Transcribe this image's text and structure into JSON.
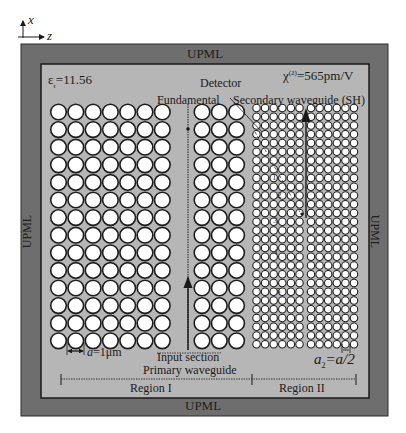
{
  "axes": {
    "x_label": "x",
    "z_label": "z"
  },
  "upml": {
    "top": "UPML",
    "bottom": "UPML",
    "left": "UPML",
    "right": "UPML"
  },
  "labels": {
    "permittivity": "ε",
    "permittivity_sub": "r",
    "permittivity_value": "=11.56",
    "chi_symbol": "χ",
    "chi_sup": "(2)",
    "chi_value": "=565pm/V",
    "detector": "Detector",
    "fundamental": "Fundamental",
    "secondary_waveguide": "Secondary waveguide (SH)",
    "lattice_a_var": "a",
    "lattice_a_value": "=1μm",
    "input_section": "Input section",
    "primary_waveguide": "Primary waveguide",
    "a2_var": "a",
    "a2_sub": "2",
    "a2_value": "=a/2",
    "region1": "Region I",
    "region2": "Region II"
  },
  "detector_numbers": [
    "1",
    "2",
    "3",
    "4",
    "5"
  ],
  "colors": {
    "page_bg": "#ffffff",
    "upml": "#6e6e6e",
    "domain": "#b6b6b6",
    "hole_fill": "#ffffff",
    "hole_stroke": "#1e1e1e",
    "line": "#1a1a1a"
  },
  "lattice": {
    "region1_left": {
      "cols": 7,
      "rows": 14,
      "x0": 58.5,
      "y0": 112,
      "dx": 17.3,
      "dy": 17.6,
      "r": 7.8
    },
    "region1_right": {
      "cols": 3,
      "rows": 14,
      "x0": 202,
      "y0": 112,
      "dx": 17.3,
      "dy": 17.6,
      "r": 7.8
    },
    "region2_left": {
      "cols": 6,
      "rows": 28,
      "x0": 256.5,
      "y0": 108,
      "dx": 8.6,
      "dy": 8.75,
      "r": 3.7
    },
    "region2_right": {
      "cols": 6,
      "rows": 28,
      "x0": 311,
      "y0": 108,
      "dx": 8.6,
      "dy": 8.75,
      "r": 3.7
    }
  }
}
